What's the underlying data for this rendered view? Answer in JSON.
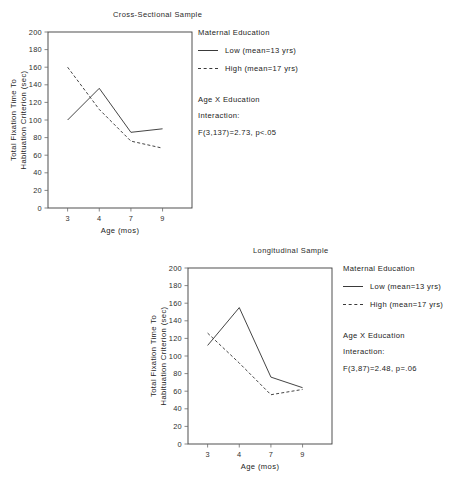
{
  "figures": [
    {
      "id": "cross-sectional",
      "title": "Cross-Sectional Sample",
      "legend": {
        "heading": "Maternal Education",
        "items": [
          {
            "label": "Low (mean=13 yrs)",
            "style": "solid"
          },
          {
            "label": "High (mean=17 yrs)",
            "style": "dashed"
          }
        ]
      },
      "stats": {
        "line1": "Age X Education",
        "line2": "Interaction:",
        "line3": "F(3,137)=2.73, p<.05"
      }
    },
    {
      "id": "longitudinal",
      "title": "Longitudinal Sample",
      "legend": {
        "heading": "Maternal Education",
        "items": [
          {
            "label": "Low (mean=13 yrs)",
            "style": "solid"
          },
          {
            "label": "High (mean=17 yrs)",
            "style": "dashed"
          }
        ]
      },
      "stats": {
        "line1": "Age X Education",
        "line2": "Interaction:",
        "line3": "F(3,87)=2.48, p=.06"
      }
    }
  ],
  "chart_data": [
    {
      "type": "line",
      "title": "Cross-Sectional Sample",
      "xlabel": "Age (mos)",
      "ylabel": "Total Fixation Time To Habituation Criterion (sec)",
      "categories": [
        "3",
        "4",
        "7",
        "9"
      ],
      "ylim": [
        0,
        200
      ],
      "yticks": [
        0,
        20,
        40,
        60,
        80,
        100,
        120,
        140,
        160,
        180,
        200
      ],
      "grid": false,
      "legend_position": "right",
      "series": [
        {
          "name": "Low (mean=13 yrs)",
          "style": "solid",
          "values": [
            100,
            136,
            86,
            90
          ]
        },
        {
          "name": "High (mean=17 yrs)",
          "style": "dashed",
          "values": [
            160,
            112,
            76,
            68
          ]
        }
      ],
      "annotations": [
        "Maternal Education",
        "Age X Education",
        "Interaction:",
        "F(3,137)=2.73, p<.05"
      ]
    },
    {
      "type": "line",
      "title": "Longitudinal Sample",
      "xlabel": "Age (mos)",
      "ylabel": "Total Fixation Time To Habituation Criterion (sec)",
      "categories": [
        "3",
        "4",
        "7",
        "9"
      ],
      "ylim": [
        0,
        200
      ],
      "yticks": [
        0,
        20,
        40,
        60,
        80,
        100,
        120,
        140,
        160,
        180,
        200
      ],
      "grid": false,
      "legend_position": "right",
      "series": [
        {
          "name": "Low (mean=13 yrs)",
          "style": "solid",
          "values": [
            112,
            155,
            76,
            64
          ]
        },
        {
          "name": "High (mean=17 yrs)",
          "style": "dashed",
          "values": [
            126,
            92,
            56,
            62
          ]
        }
      ],
      "annotations": [
        "Maternal Education",
        "Age X Education",
        "Interaction:",
        "F(3,87)=2.48, p=.06"
      ]
    }
  ]
}
